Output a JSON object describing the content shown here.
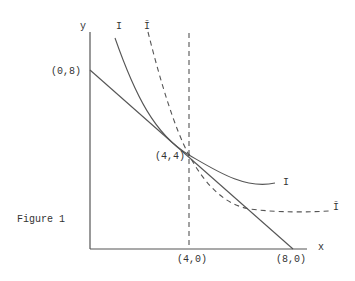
{
  "figure": {
    "caption": "Figure 1",
    "axes": {
      "x_label": "x",
      "y_label": "y"
    },
    "points": {
      "y_intercept": "(0,8)",
      "tangency": "(4,4)",
      "x_mid": "(4,0)",
      "x_intercept": "(8,0)"
    },
    "curves": {
      "indifference_solid_label_top": "I",
      "indifference_solid_label_end": "I",
      "indifference_dashed_label_top": "Ī",
      "indifference_dashed_label_end": "Ī"
    },
    "colors": {
      "line": "#555555",
      "text": "#333333",
      "background": "#ffffff"
    }
  }
}
